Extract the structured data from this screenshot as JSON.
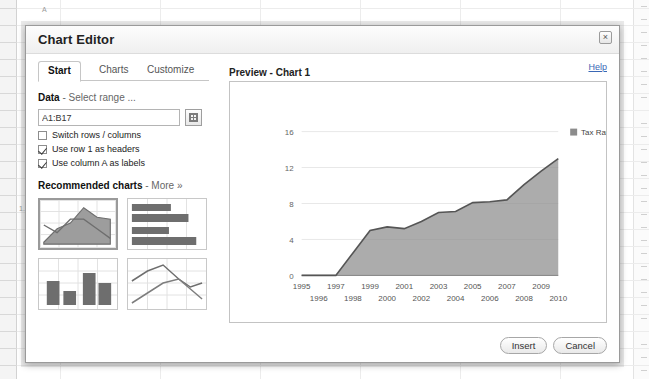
{
  "background": {
    "cell_texts": [
      {
        "text": "A",
        "x": 42,
        "y": 6
      },
      {
        "text": "1.",
        "x": 19,
        "y": 205
      }
    ]
  },
  "dialog": {
    "title": "Chart Editor",
    "close_label": "×"
  },
  "tabs": [
    {
      "label": "Start",
      "active": true
    },
    {
      "label": "Charts",
      "active": false
    },
    {
      "label": "Customize",
      "active": false
    }
  ],
  "data_section": {
    "title": "Data",
    "subtitle": "- Select range ...",
    "range_value": "A1:B17",
    "range_placeholder": "A1:B17",
    "picker_icon": "grid-icon",
    "checkboxes": [
      {
        "label": "Switch rows / columns",
        "checked": false
      },
      {
        "label": "Use row 1 as headers",
        "checked": true
      },
      {
        "label": "Use column A as labels",
        "checked": true
      }
    ]
  },
  "recommended": {
    "title": "Recommended charts",
    "more_label": "- More »",
    "thumbs": [
      {
        "name": "area-chart-thumb",
        "selected": true
      },
      {
        "name": "bar-chart-thumb",
        "selected": false
      },
      {
        "name": "column-chart-thumb",
        "selected": false
      },
      {
        "name": "line-chart-thumb",
        "selected": false
      }
    ]
  },
  "preview": {
    "label": "Preview - Chart 1",
    "help_label": "Help"
  },
  "footer": {
    "insert_label": "Insert",
    "cancel_label": "Cancel"
  },
  "chart_data": {
    "type": "area",
    "title": "",
    "xlabel": "",
    "ylabel": "",
    "legend": [
      "Tax Rate"
    ],
    "legend_position": "right-top",
    "series_color": "#8c8c8c",
    "line_color": "#555555",
    "grid": true,
    "ylim": [
      0,
      16
    ],
    "yticks": [
      0,
      4,
      8,
      12,
      16
    ],
    "categories": [
      "1995",
      "1996",
      "1997",
      "1998",
      "1999",
      "2000",
      "2001",
      "2002",
      "2003",
      "2004",
      "2005",
      "2006",
      "2007",
      "2008",
      "2009",
      "2010"
    ],
    "series": [
      {
        "name": "Tax Rate",
        "values": [
          0,
          0,
          0,
          2.5,
          5.0,
          5.4,
          5.2,
          6.0,
          7.0,
          7.1,
          8.1,
          8.2,
          8.4,
          10.1,
          11.6,
          13.0
        ]
      }
    ]
  }
}
